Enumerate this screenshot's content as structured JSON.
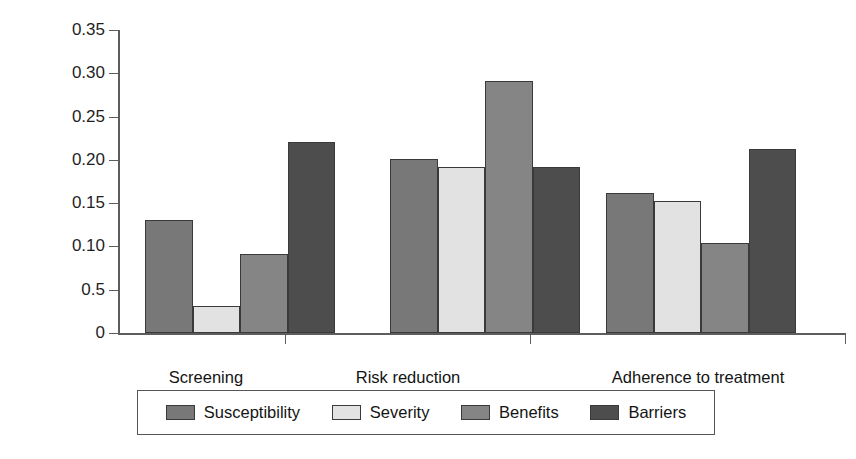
{
  "chart_data": {
    "type": "bar",
    "title": "",
    "subtitle": "",
    "xlabel": "",
    "ylabel": "Effect size (r)",
    "categories": [
      "Screening",
      "Risk reduction",
      "Adherence to treatment"
    ],
    "ylim": [
      0,
      0.35
    ],
    "ytick_labels": [
      "0.35",
      "0.30",
      "0.25",
      "0.20",
      "0.15",
      "0.10",
      "0.5",
      "0"
    ],
    "ytick_values": [
      0.35,
      0.3,
      0.25,
      0.2,
      0.15,
      0.1,
      0.05,
      0
    ],
    "grid": false,
    "legend_position": "bottom",
    "series": [
      {
        "name": "Susceptibility",
        "color": "#787878",
        "values": [
          0.13,
          0.201,
          0.162
        ]
      },
      {
        "name": "Severity",
        "color": "#e2e2e2",
        "values": [
          0.031,
          0.192,
          0.153
        ]
      },
      {
        "name": "Benefits",
        "color": "#858585",
        "values": [
          0.091,
          0.291,
          0.104
        ]
      },
      {
        "name": "Barriers",
        "color": "#4d4d4d",
        "values": [
          0.221,
          0.192,
          0.212
        ]
      }
    ],
    "annotations": []
  },
  "legend": {
    "entries": [
      {
        "label": "Susceptibility"
      },
      {
        "label": "Severity"
      },
      {
        "label": "Benefits"
      },
      {
        "label": "Barriers"
      }
    ]
  }
}
